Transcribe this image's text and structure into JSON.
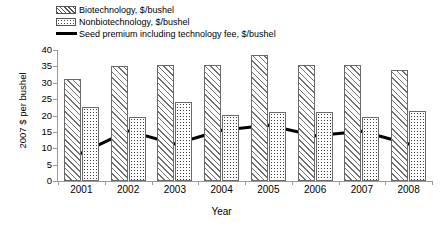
{
  "chart_data": {
    "type": "bar",
    "title": "",
    "xlabel": "Year",
    "ylabel": "2007 $ per bushel",
    "categories": [
      "2001",
      "2002",
      "2003",
      "2004",
      "2005",
      "2006",
      "2007",
      "2008"
    ],
    "ylim": [
      0,
      40
    ],
    "yticks": [
      0,
      5,
      10,
      15,
      20,
      25,
      30,
      35,
      40
    ],
    "grid": false,
    "legend_position": "top-left",
    "series": [
      {
        "name": "Biotechnology, $/bushel",
        "type": "bar",
        "pattern": "diagonal-hatch",
        "values": [
          31.0,
          35.0,
          35.5,
          35.5,
          38.5,
          35.5,
          35.5,
          34.0
        ]
      },
      {
        "name": "Nonbiotechnology, $/bushel",
        "type": "bar",
        "pattern": "dotted",
        "values": [
          22.5,
          19.5,
          24.0,
          20.3,
          21.0,
          21.0,
          19.5,
          21.5
        ]
      },
      {
        "name": "Seed premium including technology fee, $/bushel",
        "type": "line",
        "pattern": "solid-black",
        "values": [
          8.5,
          15.3,
          11.3,
          15.5,
          17.0,
          13.8,
          15.2,
          11.3
        ]
      }
    ]
  },
  "legend": {
    "items": [
      {
        "label": "Biotechnology,  $/bushel",
        "swatch": "hatch-swatch"
      },
      {
        "label": "Nonbiotechnology,  $/bushel",
        "swatch": "dot-swatch"
      },
      {
        "label": "Seed premium including technology fee, $/bushel",
        "swatch": "line-swatch"
      }
    ]
  },
  "axes": {
    "y_title": "2007 $ per bushel",
    "x_title": "Year"
  },
  "colors": {
    "line": "#000000",
    "bar_outline": "#6a6a6a",
    "axis": "#999999",
    "background": "#ffffff"
  }
}
